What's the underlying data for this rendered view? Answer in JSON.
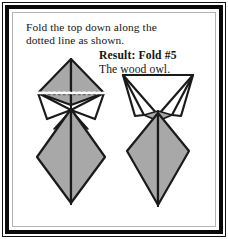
{
  "card": {
    "border_color": "#0a0a0a",
    "inner_line_color": "#b4b4b4",
    "background": "#ffffff"
  },
  "instruction": {
    "line1": "Fold the top down along the",
    "line2": "dotted line as shown."
  },
  "result": {
    "title": "Result: Fold #5",
    "subtitle": "The wood owl."
  },
  "figures": {
    "stroke_color": "#1a1a1a",
    "fill_gray": "#a8a8a8",
    "fill_white": "#ffffff",
    "left": {
      "name": "origami-before-fold",
      "caption_ref": "dotted line as shown",
      "fold_line_style": "dotted"
    },
    "right": {
      "name": "origami-wood-owl-result",
      "caption_ref": "The wood owl."
    }
  }
}
